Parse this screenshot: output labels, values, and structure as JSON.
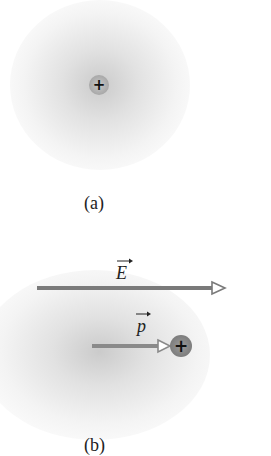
{
  "panels": {
    "a": {
      "caption": "(a)",
      "charge_symbol": "+",
      "charge_sign": "positive"
    },
    "b": {
      "caption": "(b)",
      "field_label": "E",
      "dipole_label": "p",
      "charge_symbol": "+",
      "charge_sign": "positive",
      "field_direction": "right",
      "dipole_direction": "right"
    }
  },
  "colors": {
    "arrow": "#7a7a7a",
    "arrow_head_fill": "#ffffff",
    "cloud": "#b0b0b0",
    "charge_a": "#a8a8a8",
    "charge_b": "#808080",
    "text": "#222222"
  }
}
